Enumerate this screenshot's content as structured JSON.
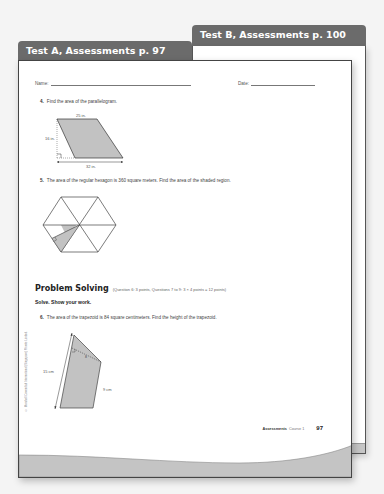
{
  "tabs": {
    "test_b": "Test B, Assessments p. 100",
    "test_a": "Test A, Assessments p. 97"
  },
  "header": {
    "name_label": "Name:",
    "date_label": "Date:"
  },
  "questions": [
    {
      "number": "4.",
      "text": "Find the area of the parallelogram.",
      "figure": {
        "type": "parallelogram",
        "top_label": "25 in.",
        "height_label": "16 in.",
        "bottom_label": "32 in."
      }
    },
    {
      "number": "5.",
      "text": "The area of the regular hexagon is 360 square meters. Find the area of the shaded region.",
      "figure": {
        "type": "hexagon",
        "shaded": "half of one triangle"
      }
    },
    {
      "number": "6.",
      "text": "The area of the trapezoid is 84 square centimeters. Find the height of the trapezoid.",
      "figure": {
        "type": "trapezoid",
        "left_label": "15 cm",
        "right_label": "9 cm",
        "height_label": "h"
      }
    }
  ],
  "problem_solving": {
    "title": "Problem Solving",
    "note": "(Question 6: 3 points, Questions 7 to 9: 3 × 4 points = 12 points)",
    "instruction": "Solve. Show your work."
  },
  "copyright": "© Marshall Cavendish International (Singapore) Private Limited.",
  "footer": {
    "label": "Assessments",
    "course": "Course 1",
    "page": "97"
  }
}
